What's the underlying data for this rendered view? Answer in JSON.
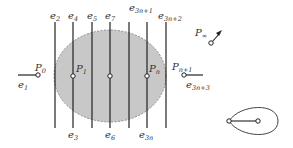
{
  "diagram": {
    "region": {
      "fill": "#c8c8c8",
      "stroke": "#777777",
      "style": "dashed ellipse"
    },
    "top_labels": [
      {
        "base": "e",
        "sub": "2"
      },
      {
        "base": "e",
        "sub": "4"
      },
      {
        "base": "e",
        "sub": "5"
      },
      {
        "base": "e",
        "sub": "7"
      },
      {
        "base": "e",
        "sub": "3n+1"
      },
      {
        "base": "e",
        "sub": "3n+2"
      }
    ],
    "bottom_labels": [
      {
        "base": "e",
        "sub": "3"
      },
      {
        "base": "e",
        "sub": "6"
      },
      {
        "base": "e",
        "sub": "3n"
      }
    ],
    "points": {
      "p0": {
        "base": "P",
        "sub": "0"
      },
      "p1": {
        "base": "P",
        "sub": "1"
      },
      "pn": {
        "base": "P",
        "sub": "n"
      },
      "pn1": {
        "base": "P",
        "sub": "n+1"
      },
      "pinf": {
        "base": "P",
        "sub": "∞"
      }
    },
    "edge_labels": {
      "e1": {
        "base": "e",
        "sub": "1"
      },
      "e3n3": {
        "base": "e",
        "sub": "3n+3"
      }
    },
    "icons": [
      "arrow-icon",
      "teardrop-loop-icon"
    ]
  }
}
